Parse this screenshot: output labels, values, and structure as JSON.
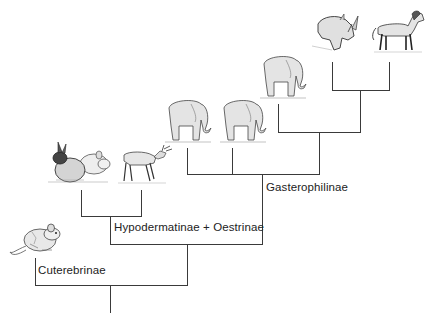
{
  "diagram": {
    "type": "cladogram",
    "title": "",
    "clade_labels": {
      "cuterebrinae": "Cuterebrinae",
      "hypodermatinae_oestrinae": "Hypodermatinae + Oestrinae",
      "gasterophilinae": "Gasterophilinae"
    },
    "host_icons": [
      {
        "id": "mouse",
        "icon": "rodent-icon",
        "clade": "Cuterebrinae"
      },
      {
        "id": "rabbit-rodent",
        "icon": "rabbit-icon",
        "clade": "Hypodermatinae + Oestrinae"
      },
      {
        "id": "deer",
        "icon": "deer-icon",
        "clade": "Hypodermatinae + Oestrinae"
      },
      {
        "id": "elephant-1",
        "icon": "elephant-icon",
        "clade": "Gasterophilinae"
      },
      {
        "id": "elephant-2",
        "icon": "elephant-icon",
        "clade": "Gasterophilinae"
      },
      {
        "id": "elephant-3",
        "icon": "elephant-icon",
        "clade": "Gasterophilinae"
      },
      {
        "id": "rhinoceros",
        "icon": "rhinoceros-icon",
        "clade": "Gasterophilinae"
      },
      {
        "id": "horse",
        "icon": "horse-icon",
        "clade": "Gasterophilinae"
      }
    ],
    "line_color": "#3a3a3a"
  }
}
